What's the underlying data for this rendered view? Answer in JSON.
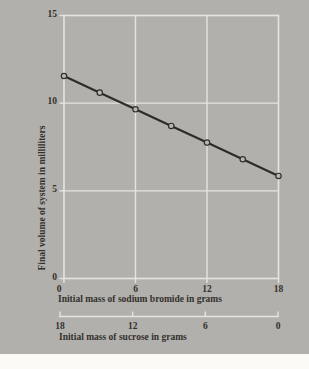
{
  "palette": {
    "page_bg": "#fbfaf7",
    "panel_bg": "#b2b0ad",
    "grid_line": "#e6e4df",
    "text_ink": "#32302c",
    "data_line": "#2e2c29",
    "marker_fill": "#bab8b5"
  },
  "chart_data": {
    "type": "line",
    "title": "",
    "x": [
      0,
      3,
      6,
      9,
      12,
      15,
      18
    ],
    "series": [
      {
        "name": "final volume of system",
        "values": [
          11.55,
          10.6,
          9.65,
          8.7,
          7.75,
          6.8,
          5.85
        ]
      }
    ],
    "xlabel": "Initial mass of sodium bromide in grams",
    "ylabel": "Final volume of system in milliliters",
    "x2label": "Initial mass of sucrose in grams",
    "xlim": [
      0,
      18
    ],
    "ylim": [
      0,
      15
    ],
    "x_ticks": [
      0,
      6,
      12,
      18
    ],
    "y_ticks": [
      0,
      5,
      10,
      15
    ],
    "x2_ticks": [
      18,
      12,
      6,
      0
    ],
    "grid": "on",
    "legend": "none",
    "marker": "open-circle"
  }
}
